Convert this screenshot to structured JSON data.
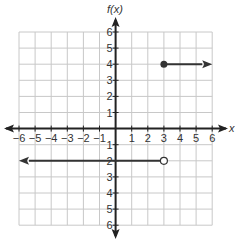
{
  "chart_data": {
    "type": "line",
    "title": "",
    "xlabel": "x",
    "ylabel": "f(x)",
    "xlim": [
      -6,
      6
    ],
    "ylim": [
      -6,
      6
    ],
    "grid": true,
    "x_ticks": [
      -6,
      -5,
      -4,
      -3,
      -2,
      -1,
      1,
      2,
      3,
      4,
      5,
      6
    ],
    "y_ticks": [
      6,
      5,
      4,
      3,
      2,
      1,
      -1,
      -2,
      -3,
      -4,
      -5,
      -6
    ],
    "x_tick_labels": [
      "−6",
      "−5",
      "−4",
      "−3",
      "−2",
      "−1",
      "1",
      "2",
      "3",
      "4",
      "5",
      "6"
    ],
    "y_tick_labels": [
      "6",
      "5",
      "4",
      "3",
      "2",
      "1",
      "1",
      "2",
      "3",
      "4",
      "5",
      "6"
    ],
    "series": [
      {
        "name": "piece-1",
        "description": "f(x) = 4 for x >= 3",
        "start": {
          "x": 3,
          "y": 4,
          "endpoint": "closed"
        },
        "end": {
          "x": 6,
          "y": 4,
          "endpoint": "arrow"
        }
      },
      {
        "name": "piece-2",
        "description": "f(x) = -2 for x < 3",
        "start": {
          "x": 3,
          "y": -2,
          "endpoint": "open"
        },
        "end": {
          "x": -6,
          "y": -2,
          "endpoint": "arrow"
        }
      }
    ]
  },
  "colors": {
    "grid": "#c8c8c8",
    "axis": "#222222",
    "line": "#333333",
    "text": "#333333"
  }
}
